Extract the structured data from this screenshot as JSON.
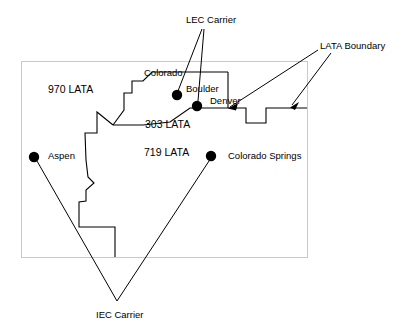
{
  "figure": {
    "type": "telecom-lata-map-diagram",
    "background_color": "#ffffff",
    "line_color": "#000000",
    "frame_color": "#c8c8c8",
    "width": 411,
    "height": 330
  },
  "annotations": {
    "lec_carrier": {
      "label": "LEC Carrier",
      "x": 186,
      "y": 14
    },
    "lata_boundary": {
      "label": "LATA Boundary",
      "x": 320,
      "y": 40
    },
    "iec_carrier": {
      "label": "IEC Carrier",
      "x": 96,
      "y": 309
    }
  },
  "region_labels": [
    {
      "name": "970-lata",
      "label": "970 LATA",
      "x": 48,
      "y": 84
    },
    {
      "name": "303-lata",
      "label": "303 LATA",
      "x": 145,
      "y": 119
    },
    {
      "name": "719-lata",
      "label": "719 LATA",
      "x": 144,
      "y": 147
    }
  ],
  "state_label": {
    "name": "colorado",
    "label": "Colorado",
    "x": 144,
    "y": 67
  },
  "cities": [
    {
      "name": "boulder",
      "label": "Boulder",
      "dot_x": 177,
      "dot_y": 95,
      "dot_r": 5.2,
      "label_x": 186,
      "label_y": 83
    },
    {
      "name": "denver",
      "label": "Denver",
      "dot_x": 197,
      "dot_y": 106,
      "dot_r": 5.2,
      "label_x": 210,
      "label_y": 95
    },
    {
      "name": "aspen",
      "label": "Aspen",
      "dot_x": 34,
      "dot_y": 157,
      "dot_r": 5.2,
      "label_x": 48,
      "label_y": 150
    },
    {
      "name": "colorado-springs",
      "label": "Colorado Springs",
      "dot_x": 211,
      "dot_y": 156,
      "dot_r": 5.2,
      "label_x": 228,
      "label_y": 150
    }
  ],
  "geometry": {
    "outer_frame": {
      "x": 21,
      "y": 61,
      "width": 286,
      "height": 196
    },
    "lata_boundary_path": "M 228,72 L 228,108 L 190,108 L 170,122 L 143,125 L 113,125 L 97,112 L 97,132 L 85,133 L 88,160 L 86,176 L 93,183 L 86,190 L 86,200 L 80,201 L 80,210 L 80,218 L 80,226 L 115,226 L 115,257",
    "lata_boundary_path2": "M 228,72 L 171,72 L 152,72 L 143,81 L 132,81 L 132,93 L 124,93 L 124,109 L 113,125",
    "lata_right_step": "M 228,108 L 246,108 L 246,122 L 265,122 L 265,108 L 307,108",
    "lower_step": "M 115,226 L 115,257",
    "lec_lines": [
      {
        "from": [
          201,
          29
        ],
        "to": [
          178,
          92
        ]
      },
      {
        "from": [
          203,
          29
        ],
        "to": [
          198,
          102
        ]
      }
    ],
    "lata_arrows": [
      {
        "from": [
          320,
          49
        ],
        "to": [
          228,
          108
        ]
      },
      {
        "from": [
          330,
          52
        ],
        "to": [
          290,
          106
        ]
      }
    ],
    "iec_lines": [
      {
        "from": [
          36,
          160
        ],
        "to": [
          117,
          301
        ]
      },
      {
        "from": [
          211,
          160
        ],
        "to": [
          117,
          301
        ]
      }
    ]
  }
}
